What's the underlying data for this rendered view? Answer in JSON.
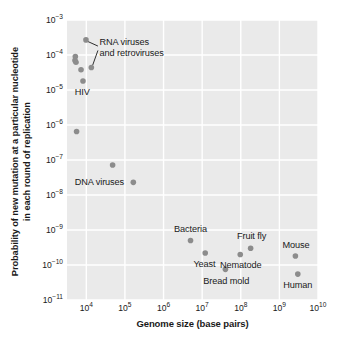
{
  "chart_data": {
    "type": "scatter",
    "title": "",
    "xlabel": "Genome size (base pairs)",
    "ylabel": "Probability of new mutation at a particular nucleotide\nin each round of replication",
    "xscale": "log",
    "yscale": "log",
    "xlim": [
      3162,
      10000000000
    ],
    "ylim": [
      1e-11,
      0.001
    ],
    "xticks": [
      {
        "value": 10000,
        "label": "10",
        "exp": "4"
      },
      {
        "value": 100000,
        "label": "10",
        "exp": "5"
      },
      {
        "value": 1000000,
        "label": "10",
        "exp": "6"
      },
      {
        "value": 10000000,
        "label": "10",
        "exp": "7"
      },
      {
        "value": 100000000,
        "label": "10",
        "exp": "8"
      },
      {
        "value": 1000000000,
        "label": "10",
        "exp": "9"
      },
      {
        "value": 10000000000,
        "label": "10",
        "exp": "10"
      }
    ],
    "yticks": [
      {
        "value": 0.001,
        "label": "10",
        "exp": "−3"
      },
      {
        "value": 0.0001,
        "label": "10",
        "exp": "−4"
      },
      {
        "value": 1e-05,
        "label": "10",
        "exp": "−5"
      },
      {
        "value": 1e-06,
        "label": "10",
        "exp": "−6"
      },
      {
        "value": 1e-07,
        "label": "10",
        "exp": "−7"
      },
      {
        "value": 1e-08,
        "label": "10",
        "exp": "−8"
      },
      {
        "value": 1e-09,
        "label": "10",
        "exp": "−9"
      },
      {
        "value": 1e-10,
        "label": "10",
        "exp": "−10"
      },
      {
        "value": 1e-11,
        "label": "10",
        "exp": "−11"
      }
    ],
    "grid": true,
    "grid_color": "#ffffff",
    "plot_bg": "#eaeaea",
    "marker_color": "#8c8c8c",
    "marker_size": 5.6,
    "points": [
      {
        "name": "rna-virus-1",
        "x": 9800,
        "y": 0.00027
      },
      {
        "name": "rna-virus-2",
        "x": 5200,
        "y": 9e-05
      },
      {
        "name": "rna-virus-3",
        "x": 5100,
        "y": 7e-05
      },
      {
        "name": "rna-virus-4",
        "x": 5400,
        "y": 6.2e-05
      },
      {
        "name": "rna-virus-5",
        "x": 7300,
        "y": 3.8e-05
      },
      {
        "name": "rna-virus-6",
        "x": 13500,
        "y": 4.4e-05
      },
      {
        "name": "hiv",
        "x": 8200,
        "y": 1.8e-05
      },
      {
        "name": "dna-virus-1",
        "x": 5600,
        "y": 6.5e-07
      },
      {
        "name": "dna-virus-2",
        "x": 48000,
        "y": 7.2e-08
      },
      {
        "name": "dna-virus-3",
        "x": 165000,
        "y": 2.3e-08
      },
      {
        "name": "bacteria",
        "x": 5000000.0,
        "y": 5e-10
      },
      {
        "name": "yeast",
        "x": 12000000.0,
        "y": 2.2e-10
      },
      {
        "name": "bread-mold",
        "x": 40000000.0,
        "y": 7.5e-11
      },
      {
        "name": "nematode",
        "x": 97000000.0,
        "y": 2e-10
      },
      {
        "name": "fruit-fly",
        "x": 180000000.0,
        "y": 3e-10
      },
      {
        "name": "mouse",
        "x": 2600000000.0,
        "y": 1.8e-10
      },
      {
        "name": "human",
        "x": 3000000000.0,
        "y": 5.5e-11
      }
    ],
    "annotations": [
      {
        "name": "rna-viruses-label",
        "text": "RNA viruses\nand retroviruses",
        "x": 22000,
        "y": 0.000155,
        "anchor": "start",
        "leaders": [
          {
            "from_x": 20000,
            "from_y": 0.00018,
            "to_x": 10800,
            "to_y": 0.000245
          },
          {
            "from_x": 20000,
            "from_y": 0.000135,
            "to_x": 14600,
            "to_y": 5.1e-05
          }
        ]
      },
      {
        "name": "hiv-label",
        "text": "HIV",
        "x": 5000,
        "y": 9e-06,
        "anchor": "start",
        "leaders": []
      },
      {
        "name": "dna-viruses-label",
        "text": "DNA viruses",
        "x": 5000,
        "y": 2.3e-08,
        "anchor": "start",
        "leaders": []
      },
      {
        "name": "bacteria-label",
        "text": "Bacteria",
        "x": 5000000.0,
        "y": 1.05e-09,
        "anchor": "mid",
        "leaders": []
      },
      {
        "name": "yeast-label",
        "text": "Yeast",
        "x": 11500000.0,
        "y": 1.05e-10,
        "anchor": "mid",
        "leaders": []
      },
      {
        "name": "bread-mold-label",
        "text": "Bread mold",
        "x": 42000000.0,
        "y": 3.6e-11,
        "anchor": "mid",
        "leaders": []
      },
      {
        "name": "nematode-label",
        "text": "Nematode",
        "x": 100000000.0,
        "y": 9.7e-11,
        "anchor": "mid",
        "leaders": []
      },
      {
        "name": "fruit-fly-label",
        "text": "Fruit fly",
        "x": 190000000.0,
        "y": 6.6e-10,
        "anchor": "mid",
        "leaders": []
      },
      {
        "name": "mouse-label",
        "text": "Mouse",
        "x": 2700000000.0,
        "y": 3.8e-10,
        "anchor": "mid",
        "leaders": []
      },
      {
        "name": "human-label",
        "text": "Human",
        "x": 3000000000.0,
        "y": 2.7e-11,
        "anchor": "mid",
        "leaders": []
      }
    ]
  }
}
